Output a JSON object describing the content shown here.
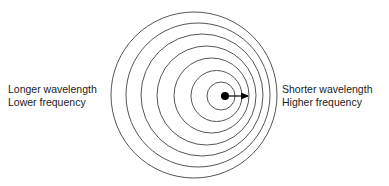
{
  "diagram": {
    "type": "doppler-effect",
    "left_label": {
      "line1": "Longer wavelength",
      "line2": "Lower frequency"
    },
    "right_label": {
      "line1": "Shorter wavelength",
      "line2": "Higher frequency"
    },
    "wavefronts": [
      {
        "cx": 194,
        "cy": 95,
        "r": 83
      },
      {
        "cx": 198,
        "cy": 95,
        "r": 72
      },
      {
        "cx": 202,
        "cy": 95,
        "r": 61
      },
      {
        "cx": 206.5,
        "cy": 95.5,
        "r": 49.5
      },
      {
        "cx": 211.5,
        "cy": 95.5,
        "r": 37.5
      },
      {
        "cx": 216.5,
        "cy": 96,
        "r": 25.5
      },
      {
        "cx": 221,
        "cy": 96,
        "r": 14
      }
    ],
    "source": {
      "cx": 225,
      "cy": 96,
      "r": 4
    },
    "motion_arrow": {
      "x1": 225,
      "y1": 96,
      "x2": 248,
      "y2": 96,
      "direction": "right"
    },
    "colors": {
      "stroke": "#555555",
      "source": "#000000",
      "text": "#222222"
    }
  }
}
